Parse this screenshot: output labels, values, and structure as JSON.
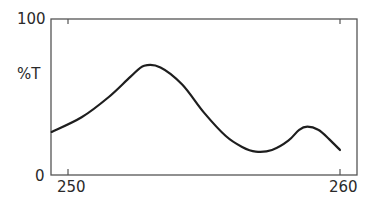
{
  "chart_data": {
    "type": "line",
    "title": "",
    "xlabel": "",
    "ylabel": "%T",
    "xlim": [
      249.4,
      260.6
    ],
    "ylim": [
      0,
      100
    ],
    "x_ticks": [
      250,
      260
    ],
    "y_ticks": [
      0,
      100
    ],
    "grid": false,
    "legend": null,
    "series": [
      {
        "name": "%T",
        "x": [
          249.4,
          250.5,
          251.5,
          252.3,
          252.8,
          253.4,
          254.2,
          255.0,
          255.8,
          256.4,
          256.9,
          257.5,
          258.1,
          258.5,
          258.8,
          259.2,
          259.6,
          260.0
        ],
        "y": [
          27.6,
          37,
          50,
          63,
          70,
          69,
          58,
          40,
          25,
          18,
          15,
          16,
          22,
          29,
          31,
          29,
          23,
          16
        ]
      }
    ]
  },
  "axes": {
    "y_top_label": "100",
    "y_bottom_label": "0",
    "y_axis_title": "%T",
    "x_left_label": "250",
    "x_right_label": "260"
  }
}
